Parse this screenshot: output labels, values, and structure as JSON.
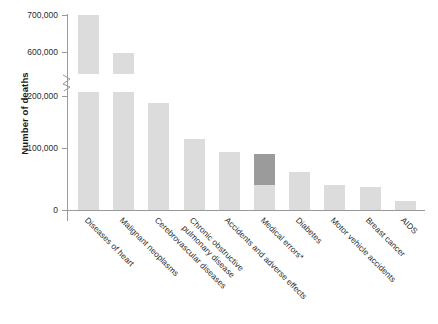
{
  "chart_data": {
    "type": "bar",
    "title": "",
    "subtitle": "",
    "xlabel": "",
    "ylabel": "Number of deaths",
    "categories": [
      "Diseases of heart",
      "Malignant neoplasms",
      "Cerebrovascular diseases",
      "Chronic obstructive\npulmonary disease",
      "Accidents and adverse effects",
      "Medical errors*",
      "Diabetes",
      "Motor vehicle accidents",
      "Breast cancer",
      "AIDS"
    ],
    "values": [
      700000,
      598000,
      188000,
      125000,
      102000,
      98000,
      66000,
      43000,
      41000,
      16000
    ],
    "highlight": {
      "category": "Medical errors*",
      "index": 5,
      "range_low": 44000,
      "range_high": 98000,
      "note": "dark-shaded uncertainty band on the Medical errors bar"
    },
    "ylim": [
      0,
      700000
    ],
    "yticks": [
      0,
      100000,
      200000,
      600000,
      700000
    ],
    "ytick_labels": [
      "0",
      "100,000",
      "200,000",
      "600,000",
      "700,000"
    ],
    "axis_break": {
      "present": true,
      "between": [
        200000,
        600000
      ],
      "symbol": "zigzag"
    },
    "grid": false,
    "legend": "none",
    "bar_color": "#dcdcdc",
    "highlight_color": "#9b9b9b",
    "axis_color": "#9a9a9a",
    "text_color": "#2b2b2b"
  }
}
